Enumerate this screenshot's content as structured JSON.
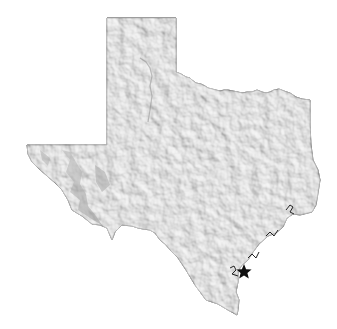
{
  "map": {
    "region": "Texas",
    "style": "shaded relief, grayscale",
    "colors": {
      "background": "#ffffff",
      "land": "#dcdcdc",
      "border": "#333333",
      "marker": "#111111"
    },
    "markers": [
      {
        "type": "star",
        "x": 244,
        "y": 272,
        "label": ""
      }
    ]
  }
}
